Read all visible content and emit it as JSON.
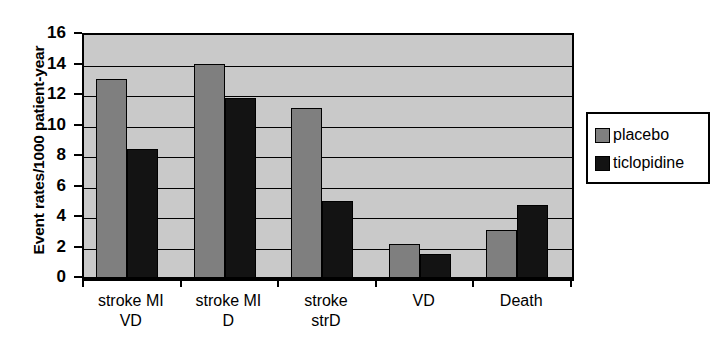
{
  "chart_data": {
    "type": "bar",
    "title": "",
    "xlabel": "",
    "ylabel": "Event rates/1000 patient-year",
    "ylim": [
      0,
      16
    ],
    "ytick_step": 2,
    "yticks": [
      16,
      14,
      12,
      10,
      8,
      6,
      4,
      2,
      0
    ],
    "grid": true,
    "legend_position": "right",
    "categories": [
      "stroke MI\nVD",
      "stroke MI\nD",
      "stroke\nstrD",
      "VD",
      "Death"
    ],
    "category_lines": [
      [
        "stroke MI",
        "VD"
      ],
      [
        "stroke MI",
        "D"
      ],
      [
        "stroke",
        "strD"
      ],
      [
        "VD",
        ""
      ],
      [
        "Death",
        ""
      ]
    ],
    "series": [
      {
        "name": "placebo",
        "color": "#7f7f7f",
        "values": [
          13.1,
          14.1,
          11.2,
          2.3,
          3.2
        ]
      },
      {
        "name": "ticlopidine",
        "color": "#131313",
        "values": [
          8.5,
          11.9,
          5.1,
          1.65,
          4.85
        ]
      }
    ]
  },
  "legend": {
    "items": [
      {
        "label": "placebo",
        "swatch": "placebo"
      },
      {
        "label": "ticlopidine",
        "swatch": "ticlopidine"
      }
    ]
  },
  "axis": {
    "y_title": "Event rates/1000 patient-year",
    "y_tick_labels": [
      "16",
      "14",
      "12",
      "10",
      "8",
      "6",
      "4",
      "2",
      "0"
    ]
  }
}
